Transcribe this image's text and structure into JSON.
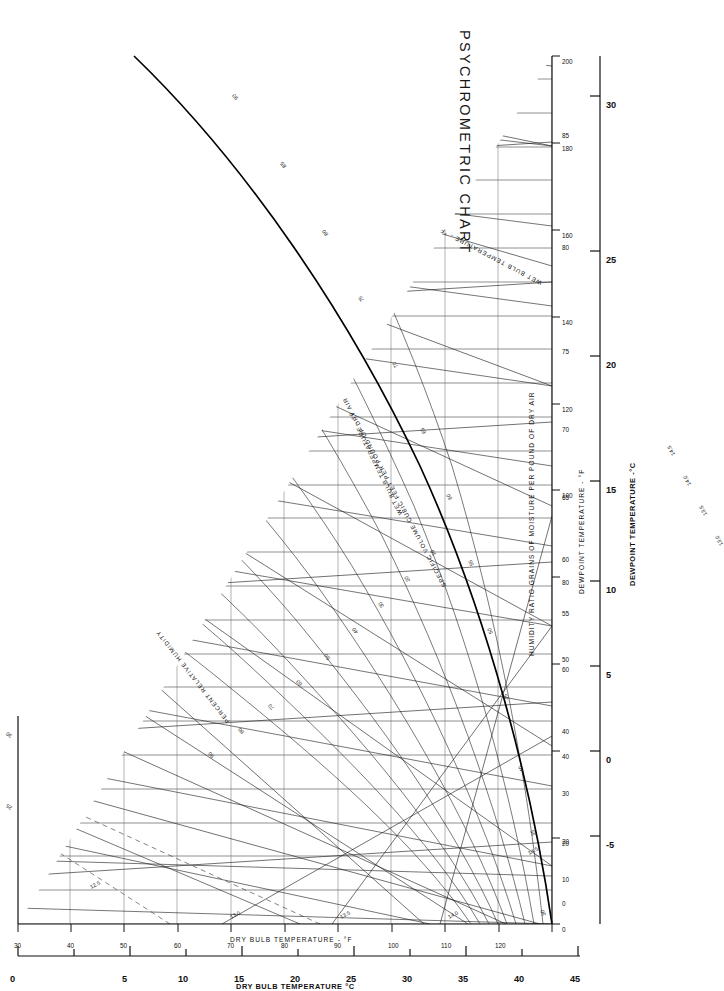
{
  "title": "PSYCHROMETRIC CHART",
  "axes": {
    "dry_bulb_c": {
      "label": "DRY BULB TEMPERATURE °C",
      "ticks": [
        0,
        5,
        10,
        15,
        20,
        25,
        30,
        35,
        40,
        45
      ],
      "unit": "°C",
      "minor_ticks": true
    },
    "dry_bulb_f": {
      "label": "DRY BULB TEMPERATURE - °F",
      "ticks": [
        30,
        40,
        50,
        60,
        70,
        80,
        90,
        100,
        110,
        120
      ],
      "unit": "°F"
    },
    "dewpoint_f": {
      "label": "DEWPOINT TEMPERATURE - °F",
      "ticks": [
        0,
        10,
        20,
        30,
        40,
        50,
        55,
        60,
        65,
        70,
        75,
        80,
        85
      ],
      "unit": "°F"
    },
    "dewpoint_c": {
      "label": "DEWPOINT TEMPERATURE -°C",
      "ticks": [
        -5,
        0,
        5,
        10,
        15,
        20,
        25,
        30
      ],
      "unit": "°C"
    },
    "humidity_ratio": {
      "label": "HUMIDITY RATIO GRAINS OF MOISTURE PER POUND OF DRY AIR",
      "ticks": [
        0,
        20,
        40,
        60,
        80,
        100,
        120,
        140,
        160,
        180,
        200
      ],
      "unit": "grains/lb"
    }
  },
  "curves": {
    "relative_humidity": {
      "label": "PERCENT RELATIVE HUMIDITY",
      "values": [
        10,
        20,
        30,
        40,
        50,
        60,
        70,
        80,
        90
      ]
    },
    "wet_bulb": {
      "label": "WET BULB TEMPERATURE - °F",
      "values": [
        30,
        35,
        40,
        45,
        50,
        55,
        60,
        65,
        70,
        75,
        80,
        85,
        90
      ]
    },
    "specific_volume": {
      "label": "SPECIFIC VOLUME CUBIC FEET PER POUND OF DRY AIR",
      "values": [
        "12.5",
        "13.0",
        "13.5",
        "14.0",
        "14.5"
      ],
      "edge_values": [
        "13.0",
        "13.5",
        "14.0",
        "14.5"
      ],
      "diagonal_values": [
        "13.0",
        "13.5",
        "14.0",
        "14.5"
      ]
    },
    "enthalpy": {
      "values": [
        25,
        30
      ]
    }
  },
  "colors": {
    "line": "#1a1a1a",
    "saturation": "#000000",
    "grid": "#555555",
    "background": "#ffffff"
  }
}
